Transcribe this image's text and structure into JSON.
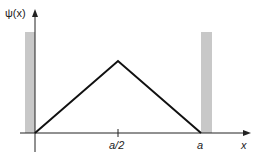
{
  "diagram": {
    "y_axis_label": "ψ(x)",
    "x_axis_label": "x",
    "tick_labels": [
      "a/2",
      "a"
    ],
    "colors": {
      "line": "#111111",
      "wall": "#c8c8c8",
      "axis": "#222222"
    },
    "function": {
      "type": "piecewise-linear",
      "points": [
        {
          "x": "0",
          "y": 0
        },
        {
          "x": "a/2",
          "y": "max"
        },
        {
          "x": "a",
          "y": 0
        }
      ]
    },
    "walls": [
      "left wall at x=0",
      "right wall at x=a"
    ]
  }
}
